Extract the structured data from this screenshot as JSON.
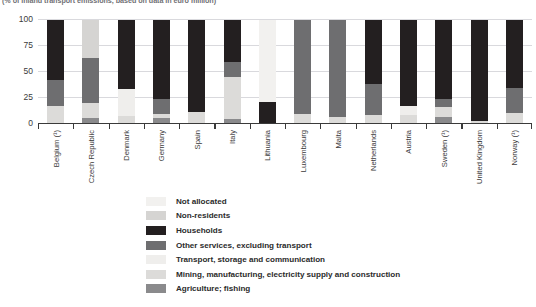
{
  "subtitle": "(% of inland transport emissions, based on data in euro million)",
  "chart_data": {
    "type": "bar",
    "subtype": "stacked-bar",
    "title": "",
    "subtitle": "(% of inland transport emissions, based on data in euro million)",
    "xlabel": "",
    "ylabel": "",
    "ylim": [
      0,
      100
    ],
    "yticks": [
      0,
      25,
      50,
      75,
      100
    ],
    "ytick_labels": [
      "0",
      "25",
      "50",
      "75",
      "100"
    ],
    "grid": true,
    "grid_axis": "y",
    "legend_position": "bottom",
    "stacked_total": 100,
    "categories": [
      "Belgium (¹)",
      "Czech Republic",
      "Denmark",
      "Germany",
      "Spain",
      "Italy",
      "Lithuania",
      "Luxembourg",
      "Malta",
      "Netherlands",
      "Austria",
      "Sweden (¹)",
      "United Kingdom",
      "Norway (¹)"
    ],
    "series": [
      {
        "name": "Not allocated",
        "color": "#f2f1ef",
        "values": [
          0,
          0,
          0,
          0,
          0,
          0,
          79,
          0,
          0,
          0,
          0,
          0,
          0,
          0
        ]
      },
      {
        "name": "Non-residents",
        "color": "#d5d4d2",
        "values": [
          0,
          37,
          0,
          0,
          0,
          0,
          0,
          0,
          0,
          0,
          0,
          0,
          0,
          0
        ]
      },
      {
        "name": "Households",
        "color": "#231f20",
        "values": [
          58,
          0,
          66,
          76,
          88,
          40,
          21,
          0,
          0,
          62,
          83,
          76,
          97,
          65
        ]
      },
      {
        "name": "Other services, excluding transport",
        "color": "#6e6e70",
        "values": [
          25,
          43,
          0,
          14,
          0,
          15,
          0,
          90,
          93,
          29,
          0,
          8,
          0,
          24
        ]
      },
      {
        "name": "Transport, storage and communication",
        "color": "#efeeec",
        "values": [
          0,
          0,
          26,
          0,
          0,
          0,
          0,
          0,
          0,
          0,
          8,
          0,
          0,
          0
        ]
      },
      {
        "name": "Mining, manufacturing, electricity supply and construction",
        "color": "#dcdbd9",
        "values": [
          17,
          14,
          8,
          4,
          12,
          40,
          0,
          10,
          7,
          9,
          9,
          9,
          3,
          11
        ]
      },
      {
        "name": "Agriculture; fishing",
        "color": "#8a8a8c",
        "values": [
          0,
          6,
          0,
          6,
          0,
          5,
          0,
          0,
          0,
          0,
          0,
          7,
          0,
          0
        ]
      }
    ]
  },
  "legend": {
    "items": [
      {
        "label": "Not allocated",
        "color": "#f2f1ef"
      },
      {
        "label": "Non-residents",
        "color": "#d5d4d2"
      },
      {
        "label": "Households",
        "color": "#231f20"
      },
      {
        "label": "Other services, excluding transport",
        "color": "#6e6e70"
      },
      {
        "label": "Transport, storage and communication",
        "color": "#efeeec"
      },
      {
        "label": "Mining, manufacturing, electricity supply and construction",
        "color": "#dcdbd9"
      },
      {
        "label": "Agriculture; fishing",
        "color": "#8a8a8c"
      }
    ]
  }
}
